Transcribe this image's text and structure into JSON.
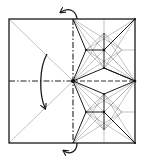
{
  "diagram": {
    "type": "origami-crease-pattern",
    "caption": "",
    "colors": {
      "line": "#1a1a1a",
      "thin_crease": "#9a9a9a",
      "background": "#ffffff"
    },
    "square": {
      "x1": 9,
      "y1": 19,
      "x2": 135,
      "y2": 143
    },
    "dividers": {
      "vertical_x": 73,
      "horizontal_y": 81
    },
    "units": [
      {
        "name": "upper",
        "cx": 104,
        "cy": 50,
        "top": [
          104,
          33
        ],
        "bottom": [
          104,
          68
        ],
        "left": [
          86,
          50
        ],
        "right": [
          122,
          50
        ]
      },
      {
        "name": "lower",
        "cx": 104,
        "cy": 112,
        "top": [
          104,
          94
        ],
        "bottom": [
          104,
          130
        ],
        "left": [
          86,
          112
        ],
        "right": [
          122,
          112
        ]
      }
    ],
    "arrows": [
      {
        "name": "fold-arrow-left-half",
        "direction": "down",
        "meaning": "fold top-left down"
      },
      {
        "name": "flip-arrow-top",
        "direction": "left"
      },
      {
        "name": "flip-arrow-bottom",
        "direction": "left"
      }
    ]
  }
}
